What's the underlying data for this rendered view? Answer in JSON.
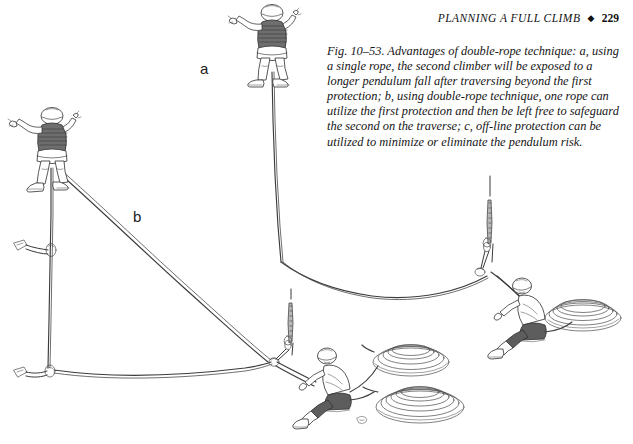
{
  "page": {
    "width": 633,
    "height": 444,
    "background_color": "#ffffff",
    "ink_color": "#2b2b2b"
  },
  "running_head": {
    "title": "PLANNING A FULL CLIMB",
    "diamond": "◆",
    "page_number": "229"
  },
  "caption": {
    "text": "Fig. 10–53. Advantages of double-rope technique: a, using a single rope, the second climber will be exposed to a longer pendulum fall after traversing beyond the first protection; b, using double-rope technique, one rope can utilize the first protection and then be left free to safeguard the second on the traverse; c, off-line protection can be utilized to minimize or eliminate the pendulum risk."
  },
  "figure_labels": {
    "a": "a",
    "b": "b"
  },
  "illustration": {
    "description": "Line drawing of two rock-climbing scenarios comparing single-rope and double-rope technique on a traverse.",
    "scenes": [
      {
        "id": "scene-a",
        "label": "a",
        "technique": "single rope",
        "climber": "second climber standing high on rock with arms raised, helmet, striped shirt",
        "belayer": "seated belayer at right holding single rope coil",
        "protection_points": 1,
        "rope_coils": 1
      },
      {
        "id": "scene-b",
        "label": "b",
        "technique": "double rope",
        "climber": "second climber standing high at left with arms raised, helmet, striped shirt",
        "belayer": "seated belayer at lower middle with two rope coils",
        "protection_points": 3,
        "rope_coils": 2
      }
    ],
    "elements": {
      "piton": "piton-icon",
      "carabiner": "carabiner-icon",
      "rope_coil": "rope-coil-icon",
      "crack": "rock-crack-icon"
    }
  }
}
